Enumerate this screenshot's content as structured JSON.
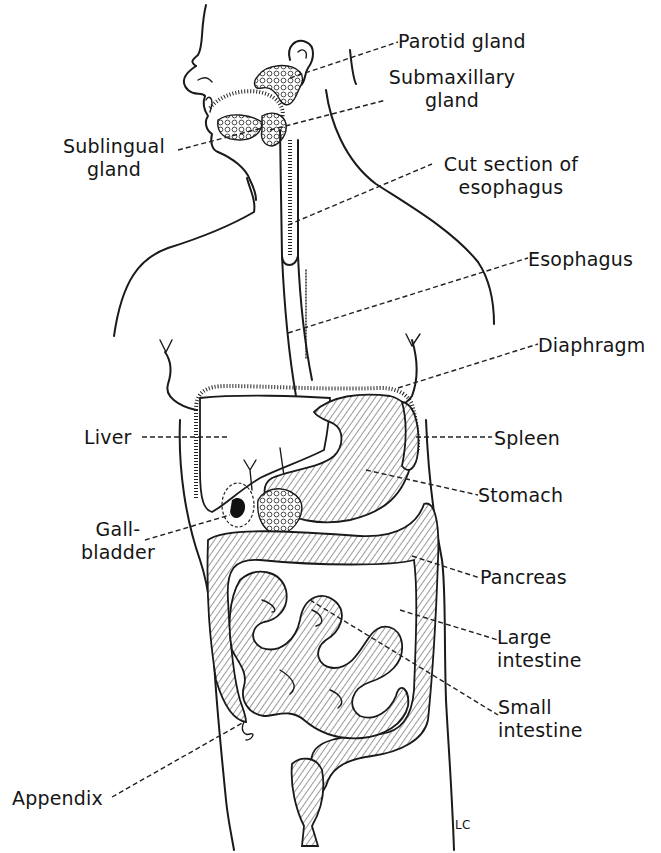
{
  "diagram": {
    "signature": "LC",
    "colors": {
      "ink": "#1a1a1a",
      "background": "#ffffff"
    },
    "labels": {
      "parotid_gland": "Parotid gland",
      "submaxillary_gland_line1": "Submaxillary",
      "submaxillary_gland_line2": "gland",
      "sublingual_gland_line1": "Sublingual",
      "sublingual_gland_line2": "gland",
      "cut_section_line1": "Cut section of",
      "cut_section_line2": "esophagus",
      "esophagus": "Esophagus",
      "diaphragm": "Diaphragm",
      "liver": "Liver",
      "spleen": "Spleen",
      "stomach": "Stomach",
      "gallbladder_line1": "Gall-",
      "gallbladder_line2": "bladder",
      "pancreas": "Pancreas",
      "large_intestine_line1": "Large",
      "large_intestine_line2": "intestine",
      "small_intestine_line1": "Small",
      "small_intestine_line2": "intestine",
      "appendix": "Appendix"
    }
  }
}
